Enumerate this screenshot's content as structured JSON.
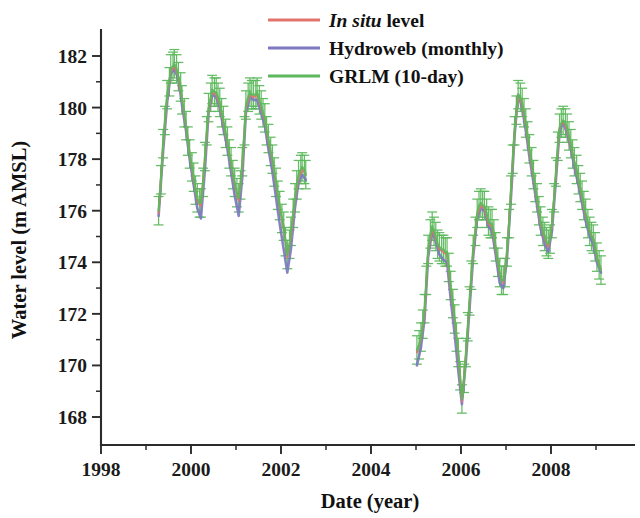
{
  "chart_data": {
    "type": "line",
    "title": "",
    "xlabel": "Date (year)",
    "ylabel": "Water level (m AMSL)",
    "xlim": [
      1998,
      2009.6
    ],
    "ylim": [
      166.9,
      182.9
    ],
    "xticks": [
      1998,
      2000,
      2002,
      2004,
      2006,
      2008
    ],
    "xtick_labels": [
      "1998",
      "2000",
      "2002",
      "2004",
      "2006",
      "2008"
    ],
    "xminor_ticks": [
      1999,
      2001,
      2003,
      2005,
      2007,
      2009
    ],
    "yticks": [
      168,
      170,
      172,
      174,
      176,
      178,
      180,
      182
    ],
    "ytick_labels": [
      "168",
      "170",
      "172",
      "174",
      "176",
      "178",
      "180",
      "182"
    ],
    "yminor_ticks": [
      169,
      171,
      173,
      175,
      177,
      179,
      181
    ],
    "grid": false,
    "legend_position": "top-center",
    "errorbars": {
      "series": "GRLM (10-day)",
      "value": 0.55,
      "cap_width_years": 0.11
    },
    "colors": {
      "in_situ": "#e3736d",
      "hydroweb": "#7d79c0",
      "grlm": "#5cb85c",
      "axis": "#2b2b2b",
      "background": "#ffffff"
    },
    "series": [
      {
        "name": "In situ level",
        "color": "#e3736d",
        "x": [
          1999.28,
          1999.38,
          1999.47,
          1999.55,
          1999.63,
          1999.72,
          1999.8,
          1999.89,
          1999.97,
          2000.06,
          2000.14,
          2000.22,
          2000.31,
          2000.39,
          2000.47,
          2000.56,
          2000.64,
          2000.72,
          2000.81,
          2000.89,
          2000.97,
          2001.06,
          2001.14,
          2001.22,
          2001.31,
          2001.39,
          2001.47,
          2001.56,
          2001.64,
          2001.72,
          2001.81,
          2001.89,
          2001.97,
          2002.06,
          2002.14,
          2002.22,
          2002.31,
          2002.39,
          2002.47,
          2002.55,
          2005.02,
          2005.11,
          2005.19,
          2005.27,
          2005.36,
          2005.44,
          2005.52,
          2005.61,
          2005.69,
          2005.77,
          2005.86,
          2005.94,
          2006.02,
          2006.11,
          2006.19,
          2006.27,
          2006.36,
          2006.44,
          2006.52,
          2006.61,
          2006.69,
          2006.77,
          2006.86,
          2006.94,
          2007.02,
          2007.11,
          2007.19,
          2007.27,
          2007.36,
          2007.44,
          2007.52,
          2007.61,
          2007.69,
          2007.77,
          2007.86,
          2007.94,
          2008.02,
          2008.11,
          2008.19,
          2008.27,
          2008.36,
          2008.44,
          2008.52,
          2008.61,
          2008.69,
          2008.77,
          2008.86,
          2008.94,
          2009.02,
          2009.11
        ],
        "y": [
          175.9,
          178.5,
          180.4,
          181.4,
          181.6,
          181.2,
          180.3,
          179.3,
          178.2,
          177.2,
          176.4,
          176.2,
          178.0,
          179.9,
          180.6,
          180.5,
          180.1,
          179.4,
          178.6,
          177.8,
          177.0,
          176.4,
          177.7,
          180.0,
          180.5,
          180.4,
          180.5,
          180.0,
          179.5,
          178.7,
          177.9,
          177.0,
          176.1,
          175.3,
          174.2,
          175.0,
          176.4,
          177.3,
          177.6,
          177.4,
          170.5,
          171.0,
          172.0,
          174.4,
          175.3,
          174.9,
          174.5,
          174.4,
          174.3,
          173.0,
          171.7,
          170.4,
          168.6,
          170.4,
          172.4,
          174.4,
          175.8,
          176.2,
          176.1,
          175.5,
          175.4,
          174.5,
          173.5,
          173.2,
          174.3,
          176.7,
          179.0,
          180.5,
          180.1,
          179.3,
          178.3,
          177.3,
          176.4,
          175.5,
          174.9,
          174.6,
          175.4,
          177.4,
          179.2,
          179.5,
          179.1,
          178.5,
          177.9,
          177.2,
          176.5,
          175.8,
          175.2,
          174.9,
          174.2,
          173.7
        ]
      },
      {
        "name": "Hydroweb (monthly)",
        "color": "#7d79c0",
        "x": [
          1999.28,
          1999.38,
          1999.47,
          1999.55,
          1999.63,
          1999.72,
          1999.8,
          1999.89,
          1999.97,
          2000.06,
          2000.14,
          2000.22,
          2000.31,
          2000.39,
          2000.47,
          2000.56,
          2000.64,
          2000.72,
          2000.81,
          2000.89,
          2000.97,
          2001.06,
          2001.14,
          2001.22,
          2001.31,
          2001.39,
          2001.47,
          2001.56,
          2001.64,
          2001.72,
          2001.81,
          2001.89,
          2001.97,
          2002.06,
          2002.14,
          2002.22,
          2002.31,
          2002.39,
          2002.47,
          2002.55,
          2005.02,
          2005.11,
          2005.19,
          2005.27,
          2005.36,
          2005.44,
          2005.52,
          2005.61,
          2005.69,
          2005.77,
          2005.86,
          2005.94,
          2006.02,
          2006.11,
          2006.19,
          2006.27,
          2006.36,
          2006.44,
          2006.52,
          2006.61,
          2006.69,
          2006.77,
          2006.86,
          2006.94,
          2007.02,
          2007.11,
          2007.19,
          2007.27,
          2007.36,
          2007.44,
          2007.52,
          2007.61,
          2007.69,
          2007.77,
          2007.86,
          2007.94,
          2008.02,
          2008.11,
          2008.19,
          2008.27,
          2008.36,
          2008.44,
          2008.52,
          2008.61,
          2008.69,
          2008.77,
          2008.86,
          2008.94,
          2009.02,
          2009.11
        ],
        "y": [
          175.8,
          178.3,
          180.2,
          181.3,
          181.5,
          181.1,
          180.1,
          179.1,
          178.0,
          177.0,
          176.1,
          175.7,
          177.6,
          179.8,
          180.5,
          180.4,
          180.0,
          179.2,
          178.4,
          177.5,
          176.6,
          175.8,
          177.3,
          179.8,
          180.4,
          180.3,
          180.3,
          179.8,
          179.3,
          178.4,
          177.5,
          176.5,
          175.5,
          174.5,
          173.6,
          174.5,
          176.1,
          177.1,
          177.4,
          177.2,
          170.0,
          170.7,
          171.8,
          174.2,
          175.2,
          174.8,
          174.3,
          174.1,
          174.0,
          172.6,
          171.2,
          169.8,
          168.5,
          170.2,
          172.2,
          174.2,
          175.7,
          176.1,
          176.0,
          175.4,
          175.2,
          174.3,
          173.2,
          173.0,
          174.1,
          176.5,
          178.9,
          180.5,
          180.0,
          179.1,
          178.1,
          177.1,
          176.2,
          175.3,
          174.7,
          174.4,
          175.2,
          177.2,
          179.1,
          179.4,
          179.0,
          178.4,
          177.7,
          177.0,
          176.3,
          175.6,
          175.0,
          174.7,
          174.0,
          173.6
        ]
      },
      {
        "name": "GRLM (10-day)",
        "color": "#5cb85c",
        "x": [
          1999.28,
          1999.33,
          1999.38,
          1999.42,
          1999.47,
          1999.52,
          1999.55,
          1999.6,
          1999.63,
          1999.68,
          1999.72,
          1999.77,
          1999.8,
          1999.85,
          1999.89,
          1999.93,
          1999.97,
          2000.02,
          2000.06,
          2000.1,
          2000.14,
          2000.19,
          2000.22,
          2000.27,
          2000.31,
          2000.35,
          2000.39,
          2000.44,
          2000.47,
          2000.52,
          2000.56,
          2000.6,
          2000.64,
          2000.68,
          2000.72,
          2000.77,
          2000.81,
          2000.85,
          2000.89,
          2000.93,
          2000.97,
          2001.02,
          2001.06,
          2001.1,
          2001.14,
          2001.19,
          2001.22,
          2001.27,
          2001.31,
          2001.35,
          2001.39,
          2001.44,
          2001.47,
          2001.52,
          2001.56,
          2001.6,
          2001.64,
          2001.68,
          2001.72,
          2001.77,
          2001.81,
          2001.85,
          2001.89,
          2001.93,
          2001.97,
          2002.02,
          2002.06,
          2002.1,
          2002.14,
          2002.19,
          2002.22,
          2002.27,
          2002.31,
          2002.35,
          2002.39,
          2002.44,
          2002.47,
          2002.52,
          2002.55,
          2005.02,
          2005.07,
          2005.11,
          2005.15,
          2005.19,
          2005.23,
          2005.27,
          2005.32,
          2005.36,
          2005.4,
          2005.44,
          2005.48,
          2005.52,
          2005.57,
          2005.61,
          2005.65,
          2005.69,
          2005.73,
          2005.77,
          2005.82,
          2005.86,
          2005.9,
          2005.94,
          2005.98,
          2006.02,
          2006.07,
          2006.11,
          2006.15,
          2006.19,
          2006.23,
          2006.27,
          2006.32,
          2006.36,
          2006.4,
          2006.44,
          2006.48,
          2006.52,
          2006.57,
          2006.61,
          2006.65,
          2006.69,
          2006.73,
          2006.77,
          2006.82,
          2006.86,
          2006.9,
          2006.94,
          2006.98,
          2007.02,
          2007.07,
          2007.11,
          2007.15,
          2007.19,
          2007.23,
          2007.27,
          2007.32,
          2007.36,
          2007.4,
          2007.44,
          2007.48,
          2007.52,
          2007.57,
          2007.61,
          2007.65,
          2007.69,
          2007.73,
          2007.77,
          2007.82,
          2007.86,
          2007.9,
          2007.94,
          2007.98,
          2008.02,
          2008.07,
          2008.11,
          2008.15,
          2008.19,
          2008.23,
          2008.27,
          2008.32,
          2008.36,
          2008.4,
          2008.44,
          2008.48,
          2008.52,
          2008.57,
          2008.61,
          2008.65,
          2008.69,
          2008.73,
          2008.77,
          2008.82,
          2008.86,
          2008.9,
          2008.94,
          2008.98,
          2009.02,
          2009.07,
          2009.11
        ],
        "y": [
          176.0,
          177.2,
          178.6,
          179.5,
          180.5,
          181.0,
          181.5,
          181.6,
          181.7,
          181.5,
          181.2,
          180.8,
          180.3,
          179.8,
          179.3,
          178.7,
          178.2,
          177.7,
          177.3,
          176.8,
          176.5,
          176.3,
          176.3,
          177.1,
          178.1,
          179.1,
          180.0,
          180.4,
          180.7,
          180.6,
          180.6,
          180.4,
          180.2,
          179.8,
          179.5,
          179.0,
          178.7,
          178.2,
          177.9,
          177.4,
          177.1,
          176.7,
          176.5,
          177.0,
          177.9,
          179.1,
          180.1,
          180.4,
          180.6,
          180.5,
          180.5,
          180.5,
          180.6,
          180.3,
          180.1,
          179.8,
          179.6,
          179.1,
          178.8,
          178.3,
          178.0,
          177.5,
          177.1,
          176.6,
          176.2,
          175.7,
          175.4,
          174.8,
          174.3,
          174.7,
          175.2,
          175.9,
          176.5,
          177.0,
          177.4,
          177.6,
          177.7,
          177.6,
          177.4,
          170.6,
          170.8,
          171.1,
          171.6,
          172.2,
          173.3,
          174.5,
          175.1,
          175.4,
          175.2,
          175.0,
          174.7,
          174.6,
          174.5,
          174.5,
          174.4,
          174.4,
          173.8,
          173.1,
          172.4,
          171.8,
          171.1,
          170.5,
          169.6,
          168.7,
          169.5,
          170.5,
          171.5,
          172.5,
          173.5,
          174.5,
          175.2,
          175.9,
          176.2,
          176.3,
          176.2,
          176.2,
          175.9,
          175.6,
          175.5,
          175.5,
          175.1,
          174.6,
          174.0,
          173.6,
          173.3,
          173.3,
          173.6,
          174.4,
          175.5,
          176.8,
          178.0,
          179.1,
          179.9,
          180.5,
          180.4,
          180.2,
          179.8,
          179.4,
          178.9,
          178.4,
          177.9,
          177.4,
          176.9,
          176.5,
          176.0,
          175.6,
          175.2,
          175.0,
          174.8,
          174.7,
          174.9,
          175.5,
          176.5,
          177.5,
          178.5,
          179.2,
          179.4,
          179.5,
          179.4,
          179.2,
          178.9,
          178.6,
          178.2,
          177.9,
          177.6,
          177.2,
          176.9,
          176.6,
          176.2,
          175.9,
          175.5,
          175.2,
          175.0,
          174.9,
          174.6,
          174.2,
          173.9,
          173.7
        ]
      }
    ]
  },
  "legend": {
    "items": [
      {
        "label_prefix": "In situ",
        "label_suffix": " level",
        "italic_prefix": true,
        "color": "#e3736d",
        "key": "in_situ"
      },
      {
        "label_prefix": "Hydroweb (monthly)",
        "label_suffix": "",
        "italic_prefix": false,
        "color": "#7d79c0",
        "key": "hydroweb"
      },
      {
        "label_prefix": "GRLM (10-day)",
        "label_suffix": "",
        "italic_prefix": false,
        "color": "#5cb85c",
        "key": "grlm"
      }
    ]
  }
}
